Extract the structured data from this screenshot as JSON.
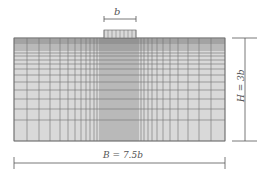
{
  "diagram": {
    "type": "finite-element-mesh",
    "labels": {
      "footing_width": "b",
      "domain_width": "B = 7.5b",
      "domain_height": "H = 3b"
    },
    "colors": {
      "mesh_fill": "#d9d9d9",
      "mesh_line": "#6e6e6e",
      "dimension_line": "#555555",
      "background": "#ffffff"
    },
    "geometry": {
      "mesh": {
        "x0": 14,
        "y0": 38,
        "x1": 225,
        "y1": 141
      },
      "footing": {
        "x0": 104,
        "y0": 30,
        "x1": 136,
        "y1": 38
      },
      "dim_b": {
        "x0": 104,
        "x1": 136,
        "y": 19
      },
      "dim_B": {
        "x0": 14,
        "x1": 225,
        "y": 163
      },
      "dim_H": {
        "x": 245,
        "y0": 38,
        "y1": 141
      }
    },
    "mesh_lines": {
      "vertical_x": [
        14,
        27,
        39,
        50,
        60,
        68,
        75,
        81,
        86,
        90,
        94,
        97,
        100,
        102,
        104,
        106,
        108,
        110,
        112,
        114,
        116,
        118,
        120,
        122,
        124,
        126,
        128,
        130,
        132,
        134,
        136,
        138,
        141,
        144,
        148,
        152,
        157,
        163,
        170,
        178,
        188,
        199,
        211,
        225
      ],
      "horizontal_y": [
        38,
        39,
        40,
        41,
        42,
        43,
        44,
        46,
        48,
        50,
        53,
        56,
        60,
        64,
        69,
        75,
        82,
        90,
        99,
        109,
        120,
        141
      ],
      "footing_vertical_x": [
        104,
        108,
        112,
        116,
        120,
        124,
        128,
        132,
        136
      ]
    }
  }
}
